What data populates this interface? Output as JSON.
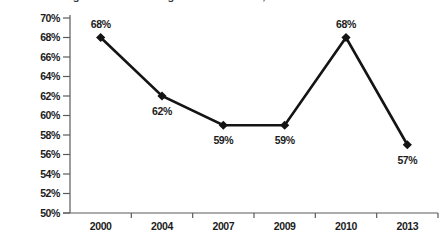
{
  "title": {
    "text": "Percentage of Firms Offering Health Insurance, Selected Years"
  },
  "chart_data": {
    "type": "line",
    "categories": [
      "2000",
      "2004",
      "2007",
      "2009",
      "2010",
      "2013"
    ],
    "series": [
      {
        "name": "Percent offering",
        "values": [
          68,
          62,
          59,
          59,
          68,
          57
        ]
      }
    ],
    "data_labels": [
      "68%",
      "62%",
      "59%",
      "59%",
      "68%",
      "57%"
    ],
    "label_positions": [
      "above",
      "below",
      "below",
      "below",
      "above",
      "below"
    ],
    "ylim": [
      50,
      70
    ],
    "ytick_step": 2,
    "ytick_labels": [
      "50%",
      "52%",
      "54%",
      "56%",
      "58%",
      "60%",
      "62%",
      "64%",
      "66%",
      "68%",
      "70%"
    ],
    "grid": false,
    "legend": "none",
    "marker": "diamond",
    "colors": {
      "line": "#141414",
      "marker": "#141414",
      "text": "#1c1c1c",
      "axis": "#5a5a5a"
    }
  }
}
